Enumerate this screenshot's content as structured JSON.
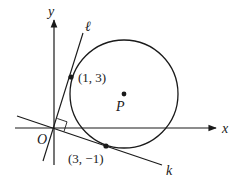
{
  "diagram": {
    "axes": {
      "x_label": "x",
      "y_label": "y",
      "origin_label": "O"
    },
    "circle": {
      "center_label": "P"
    },
    "points": [
      {
        "label": "(1, 3)",
        "x": 1,
        "y": 3
      },
      {
        "label": "(3, −1)",
        "x": 3,
        "y": -1
      }
    ],
    "lines": [
      {
        "label": "ℓ",
        "through": "(1, 3)",
        "tangent": true
      },
      {
        "label": "k",
        "through": "(3, −1)",
        "tangent": true
      }
    ],
    "right_angle_marker": "at O between lines ℓ and k",
    "colors": {
      "stroke": "#1a1a1a",
      "background": "#ffffff"
    }
  }
}
